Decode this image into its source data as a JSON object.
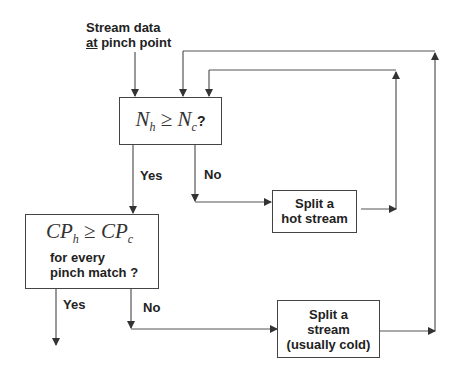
{
  "diagram": {
    "type": "flowchart",
    "start": {
      "line1": "Stream data",
      "line2_underlined": "at",
      "line2_rest": " pinch point"
    },
    "decision1": {
      "lhs": "N",
      "lhs_sub": "h",
      "op": " ≥ ",
      "rhs": "N",
      "rhs_sub": "c",
      "suffix": " ?"
    },
    "decision1_yes": "Yes",
    "decision1_no": "No",
    "action_hot": {
      "line1": "Split a",
      "line2": "hot stream"
    },
    "decision2": {
      "lhs": "CP",
      "lhs_sub": "h",
      "op": " ≥ ",
      "rhs": "CP",
      "rhs_sub": "c",
      "line2": "for every",
      "line3": "pinch match ?"
    },
    "decision2_yes": "Yes",
    "decision2_no": "No",
    "action_cold": {
      "line1": "Split a",
      "line2": "stream",
      "line3": "(usually cold)"
    }
  },
  "colors": {
    "line": "#444444",
    "text": "#222222",
    "background": "#ffffff"
  }
}
